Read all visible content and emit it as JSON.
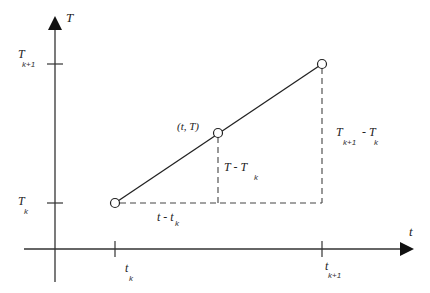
{
  "axes": {
    "y_label": "T",
    "x_label": "t",
    "y_ticks": [
      {
        "main": "T",
        "sub": "k+1"
      },
      {
        "main": "T",
        "sub": "k"
      }
    ],
    "x_ticks": [
      {
        "main": "t",
        "sub": "k"
      },
      {
        "main": "t",
        "sub": "k+1"
      }
    ]
  },
  "points": {
    "start": "(t_k, T_k)",
    "mid_label": "(t, T)",
    "end": "(t_k+1, T_k+1)"
  },
  "annotations": {
    "horizontal_diff": {
      "main": "t - t",
      "sub": "k"
    },
    "vertical_diff_mid": {
      "main": "T  -  T",
      "sub": "k"
    },
    "vertical_diff_end": {
      "main1": "T",
      "sub1": "k+1",
      "main2": "- T",
      "sub2": "k"
    }
  },
  "colors": {
    "line": "#222222",
    "dashed": "#444444"
  }
}
